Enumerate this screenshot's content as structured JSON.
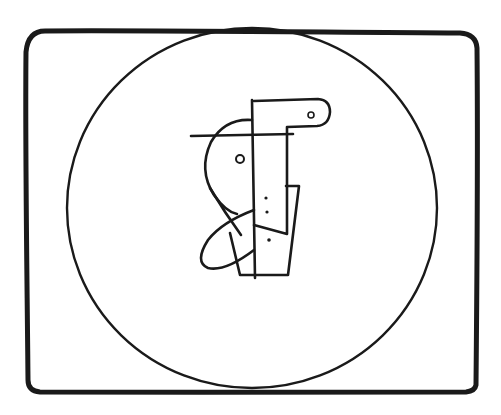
{
  "artwork": {
    "type": "line-drawing",
    "description": "Abstract figure inside a circle inside a rounded rectangular frame",
    "colors": {
      "ink": "#1a1a1a",
      "background": "#ffffff"
    }
  }
}
